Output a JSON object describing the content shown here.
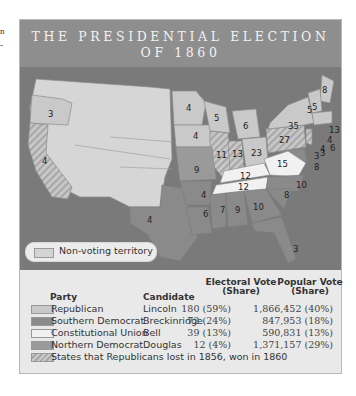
{
  "edge_fragments": [
    "n",
    "-"
  ],
  "title": {
    "line1": "THE PRESIDENTIAL ELECTION",
    "line2": "OF 1860"
  },
  "colors": {
    "banner": "#8e8e8e",
    "water": "#7a7a7a",
    "republican": "#c9c9c9",
    "southern_democrat": "#8a8a8a",
    "constitutional_union": "#f1f1f1",
    "northern_democrat": "#9a9a9a",
    "non_voting": "#d6d6d6",
    "flipped_hatch": "#b0b0b0"
  },
  "map": {
    "non_voting_legend_label": "Non-voting territory",
    "state_labels": [
      {
        "state": "Oregon",
        "ev": "3"
      },
      {
        "state": "California",
        "ev": "4"
      },
      {
        "state": "Minnesota",
        "ev": "4"
      },
      {
        "state": "Iowa",
        "ev": "4"
      },
      {
        "state": "Wisconsin",
        "ev": "5"
      },
      {
        "state": "Michigan",
        "ev": "6"
      },
      {
        "state": "Illinois",
        "ev": "11"
      },
      {
        "state": "Indiana",
        "ev": "13"
      },
      {
        "state": "Ohio",
        "ev": "23"
      },
      {
        "state": "Pennsylvania",
        "ev": "27"
      },
      {
        "state": "New York",
        "ev": "35"
      },
      {
        "state": "Vermont",
        "ev": "5"
      },
      {
        "state": "New Hampshire",
        "ev": "5"
      },
      {
        "state": "Maine",
        "ev": "8"
      },
      {
        "state": "Massachusetts",
        "ev": "13"
      },
      {
        "state": "Rhode Island",
        "ev": "4"
      },
      {
        "state": "Connecticut",
        "ev": "6"
      },
      {
        "state": "New Jersey",
        "ev": "4"
      },
      {
        "state": "Delaware",
        "ev": "3"
      },
      {
        "state": "Maryland",
        "ev": "8"
      },
      {
        "state": "New Jersey (split)",
        "ev": "3"
      },
      {
        "state": "Missouri",
        "ev": "9"
      },
      {
        "state": "Kentucky",
        "ev": "12"
      },
      {
        "state": "Virginia",
        "ev": "15"
      },
      {
        "state": "Tennessee",
        "ev": "12"
      },
      {
        "state": "North Carolina",
        "ev": "10"
      },
      {
        "state": "Arkansas",
        "ev": "4"
      },
      {
        "state": "Mississippi",
        "ev": "7"
      },
      {
        "state": "Alabama",
        "ev": "9"
      },
      {
        "state": "Georgia",
        "ev": "10"
      },
      {
        "state": "South Carolina",
        "ev": "8"
      },
      {
        "state": "Louisiana",
        "ev": "6"
      },
      {
        "state": "Texas",
        "ev": "4"
      },
      {
        "state": "Florida",
        "ev": "3"
      }
    ]
  },
  "table": {
    "headers": {
      "party": "Party",
      "candidate": "Candidate",
      "electoral_line1": "Electoral Vote",
      "electoral_line2": "(Share)",
      "popular_line1": "Popular Vote",
      "popular_line2": "(Share)"
    },
    "rows": [
      {
        "party": "Republican",
        "candidate": "Lincoln",
        "electoral": "180 (59%)",
        "popular": "1,866,452 (40%)"
      },
      {
        "party": "Southern Democrat",
        "candidate": "Breckinridge",
        "electoral": "72 (24%)",
        "popular": "847,953 (18%)"
      },
      {
        "party": "Constitutional Union",
        "candidate": "Bell",
        "electoral": "39 (13%)",
        "popular": "590,831 (13%)"
      },
      {
        "party": "Northern Democrat",
        "candidate": "Douglas",
        "electoral": "12 (4%)",
        "popular": "1,371,157 (29%)"
      }
    ],
    "footnote": "States that Republicans lost in 1856, won in 1860"
  }
}
